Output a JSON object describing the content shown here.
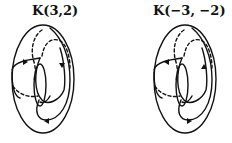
{
  "figure": {
    "panels": [
      {
        "id": "left",
        "title": "K(3,2)",
        "object": "torus knot on torus",
        "p": 3,
        "q": 2,
        "arrow_direction": "forward"
      },
      {
        "id": "right",
        "title": "K(−3, −2)",
        "object": "torus knot on torus (mirror/reversed orientation)",
        "p": -3,
        "q": -2,
        "arrow_direction": "reversed"
      }
    ],
    "colors": {
      "stroke": "#111111",
      "background": "#ffffff"
    }
  }
}
